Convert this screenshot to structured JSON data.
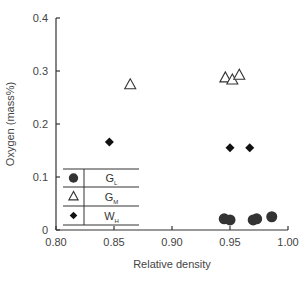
{
  "chart_data": {
    "type": "scatter",
    "title": "",
    "xlabel": "Relative density",
    "ylabel": "Oxygen (mass%)",
    "xlim": [
      0.8,
      1.0
    ],
    "ylim": [
      0,
      0.4
    ],
    "xticks": [
      "0.80",
      "0.85",
      "0.90",
      "0.95",
      "1.00"
    ],
    "yticks": [
      "0",
      "0.1",
      "0.2",
      "0.3",
      "0.4"
    ],
    "grid": false,
    "legend_position": "lower-left inside (table)",
    "series": [
      {
        "name": "GL",
        "label_main": "G",
        "label_sub": "L",
        "marker": "filled-circle",
        "color": "#333333",
        "points": [
          {
            "x": 0.945,
            "y": 0.021
          },
          {
            "x": 0.95,
            "y": 0.019
          },
          {
            "x": 0.97,
            "y": 0.019
          },
          {
            "x": 0.973,
            "y": 0.021
          },
          {
            "x": 0.986,
            "y": 0.025
          }
        ]
      },
      {
        "name": "GM",
        "label_main": "G",
        "label_sub": "M",
        "marker": "open-triangle",
        "color": "#333333",
        "points": [
          {
            "x": 0.864,
            "y": 0.274
          },
          {
            "x": 0.946,
            "y": 0.287
          },
          {
            "x": 0.952,
            "y": 0.283
          },
          {
            "x": 0.958,
            "y": 0.292
          }
        ]
      },
      {
        "name": "WH",
        "label_main": "W",
        "label_sub": "H",
        "marker": "filled-diamond",
        "color": "#111111",
        "points": [
          {
            "x": 0.846,
            "y": 0.166
          },
          {
            "x": 0.95,
            "y": 0.155
          },
          {
            "x": 0.967,
            "y": 0.155
          }
        ]
      }
    ]
  }
}
